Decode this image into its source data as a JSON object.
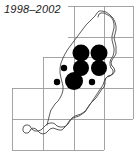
{
  "figure": {
    "title": "1998–2002",
    "title_style": "italic",
    "width": 136,
    "height": 157,
    "background_color": "#ffffff"
  },
  "map": {
    "region_name": "Isle of Man",
    "coastline_color": "#4a4a4a",
    "grid_color": "#9a9a9a",
    "dot_color": "#000000",
    "grid": {
      "x_lines": [
        12,
        43,
        74,
        104,
        133
      ],
      "y_lines": [
        6,
        37,
        57,
        88,
        119,
        150
      ],
      "cell_size_px": 31,
      "segments": [
        {
          "x1": 68,
          "y1": 6,
          "x2": 133,
          "y2": 6
        },
        {
          "x1": 68,
          "y1": 37,
          "x2": 133,
          "y2": 37
        },
        {
          "x1": 43,
          "y1": 57,
          "x2": 133,
          "y2": 57
        },
        {
          "x1": 12,
          "y1": 88,
          "x2": 133,
          "y2": 88
        },
        {
          "x1": 12,
          "y1": 119,
          "x2": 133,
          "y2": 119
        },
        {
          "x1": 12,
          "y1": 150,
          "x2": 104,
          "y2": 150
        },
        {
          "x1": 12,
          "y1": 88,
          "x2": 12,
          "y2": 150
        },
        {
          "x1": 43,
          "y1": 57,
          "x2": 43,
          "y2": 150
        },
        {
          "x1": 74,
          "y1": 6,
          "x2": 74,
          "y2": 150
        },
        {
          "x1": 104,
          "y1": 6,
          "x2": 104,
          "y2": 150
        },
        {
          "x1": 133,
          "y1": 6,
          "x2": 133,
          "y2": 119
        }
      ]
    },
    "coastline_path": "M 98 17 L 99 14 L 101 13 L 104 13 L 108 15 L 111 17 L 113 20 L 114 24 L 114 28 L 113 32 L 112 36 L 112 40 L 113 44 L 114 48 L 114 52 L 113 56 L 111 59 L 110 62 L 110 65 L 111 68 L 113 70 L 113 73 L 111 75 L 108 76 L 106 78 L 105 81 L 105 84 L 104 87 L 102 89 L 100 92 L 98 95 L 96 98 L 93 101 L 90 104 L 88 107 L 86 110 L 84 112 L 81 114 L 78 115 L 75 116 L 72 118 L 70 121 L 68 124 L 66 126 L 63 127 L 60 127 L 57 126 L 55 124 L 53 123 L 50 123 L 47 124 L 45 126 L 43 128 L 41 130 L 38 131 L 35 131 L 33 130 L 31 128 L 30 126 L 28 125 L 26 125 L 24 126 L 23 128 L 23 131 L 25 133 L 28 133 L 30 131 L 31 129 L 33 128 L 36 129 L 38 131 L 40 133 L 43 134 L 46 133 L 48 131 L 50 129 L 53 128 L 56 129 L 59 130 L 62 130 L 64 128 L 66 126 L 68 123 L 70 120 L 73 118 L 76 117 L 79 116 L 82 114 L 85 112 L 87 109 L 89 106 L 91 103 L 93 100 L 95 97 L 97 94 L 99 91 L 101 88 L 103 85 L 104 82 L 105 79 L 107 77 L 110 76 L 113 74 L 115 71 L 114 68 L 112 66 L 111 63 L 112 60 L 114 57 L 116 54 L 116 50 L 116 46 L 115 42 L 114 38 L 115 34 L 116 30 L 116 26 L 115 22 L 113 18 L 110 15 L 106 12 L 102 11 L 99 11 L 97 13 L 95 16 L 92 19 L 89 22 L 86 25 L 83 29 L 80 33 L 77 37 L 74 41 L 71 45 L 68 49 L 65 54 L 63 58 L 61 63 L 60 68 L 60 73 L 61 78 L 62 82 L 63 86 L 63 90 L 62 94 L 60 98 L 58 101 L 55 104 L 53 107 L 51 110 L 50 113 L 49 117 L 48 121 L 47 125",
    "dots": [
      {
        "id": "dot-1",
        "cx": 81,
        "cy": 53,
        "r": 8.5,
        "size": "large",
        "grid_ref": "col3-row2"
      },
      {
        "id": "dot-2",
        "cx": 99,
        "cy": 53,
        "r": 8.5,
        "size": "large",
        "grid_ref": "col4-row2"
      },
      {
        "id": "dot-3",
        "cx": 64,
        "cy": 68,
        "r": 3.2,
        "size": "small",
        "grid_ref": "col2-row3"
      },
      {
        "id": "dot-4",
        "cx": 81,
        "cy": 68,
        "r": 8.0,
        "size": "large",
        "grid_ref": "col3-row3"
      },
      {
        "id": "dot-5",
        "cx": 99,
        "cy": 68,
        "r": 8.0,
        "size": "large",
        "grid_ref": "col4-row3"
      },
      {
        "id": "dot-6",
        "cx": 57,
        "cy": 82,
        "r": 3.2,
        "size": "small",
        "grid_ref": "col2-row4"
      },
      {
        "id": "dot-7",
        "cx": 74,
        "cy": 81,
        "r": 9.0,
        "size": "large",
        "grid_ref": "col3-row4"
      },
      {
        "id": "dot-8",
        "cx": 92,
        "cy": 82,
        "r": 3.2,
        "size": "small",
        "grid_ref": "col4-row4"
      }
    ]
  }
}
